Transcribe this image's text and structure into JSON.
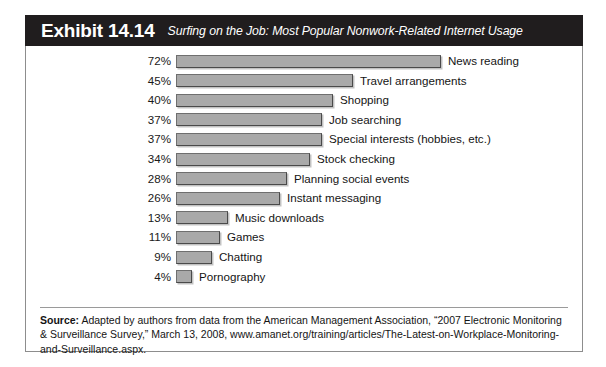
{
  "banner": {
    "exhibit_label": "Exhibit 14.14",
    "subtitle": "Surfing on the Job: Most Popular Nonwork-Related Internet Usage"
  },
  "source": {
    "label": "Source:",
    "text": " Adapted by authors from data from the American Management Association, “2007 Electronic Monitoring & Surveillance Survey,” March 13, 2008, www.amanet.org/training/articles/The-Latest-on-Workplace-Monitoring-and-Surveillance.aspx."
  },
  "chart_data": {
    "type": "bar",
    "orientation": "horizontal",
    "title": "Surfing on the Job: Most Popular Nonwork-Related Internet Usage",
    "xlabel": "",
    "ylabel": "",
    "grid": false,
    "legend": false,
    "value_suffix": "%",
    "xlim": [
      0,
      72
    ],
    "categories": [
      "News reading",
      "Travel arrangements",
      "Shopping",
      "Job searching",
      "Special interests (hobbies, etc.)",
      "Stock checking",
      "Planning social events",
      "Instant messaging",
      "Music downloads",
      "Games",
      "Chatting",
      "Pornography"
    ],
    "values": [
      72,
      45,
      40,
      37,
      37,
      34,
      28,
      26,
      13,
      11,
      9,
      4
    ],
    "value_labels": [
      "72%",
      "45%",
      "40%",
      "37%",
      "37%",
      "34%",
      "28%",
      "26%",
      "13%",
      "11%",
      "9%",
      "4%"
    ],
    "bar_pixel_lengths": [
      265,
      177,
      157,
      146,
      146,
      134,
      111,
      104,
      52,
      44,
      36,
      16
    ],
    "bar_color": "#a9a9a9",
    "bar_edge_color": "#4a4a4a"
  },
  "colors": {
    "banner_bg": "#201d1e",
    "banner_text": "#ffffff",
    "frame_border": "#8d8d8d",
    "body_bg": "#ffffff",
    "text": "#141414"
  }
}
